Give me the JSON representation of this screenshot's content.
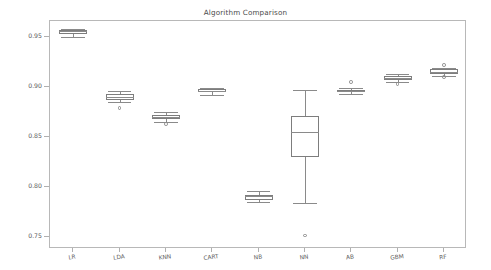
{
  "figure": {
    "width": 491,
    "height": 270,
    "background": "#ffffff",
    "frame_color": "#b8b8b8",
    "line_color": "#8a8a8a"
  },
  "chart_data": {
    "type": "box",
    "title": "Algorithm Comparison",
    "xlabel": "",
    "ylabel": "Error",
    "ylim": [
      0.7375,
      0.9665
    ],
    "yticks": [
      0.95,
      0.9,
      0.85,
      0.8,
      0.75
    ],
    "ytick_labels": [
      "0.95",
      "0.90",
      "0.85",
      "0.80",
      "0.75"
    ],
    "grid": false,
    "legend": "none",
    "categories": [
      "LR",
      "LDA",
      "KNN",
      "CART",
      "NB",
      "NN",
      "AB",
      "GBM",
      "RF"
    ],
    "boxes": [
      {
        "name": "LR",
        "whisker_low": 0.9505,
        "q1": 0.9535,
        "median": 0.9565,
        "q3": 0.9575,
        "whisker_high": 0.958,
        "fliers": []
      },
      {
        "name": "LDA",
        "whisker_low": 0.8855,
        "q1": 0.8875,
        "median": 0.8905,
        "q3": 0.893,
        "whisker_high": 0.896,
        "fliers": [
          0.879
        ]
      },
      {
        "name": "KNN",
        "whisker_low": 0.865,
        "q1": 0.868,
        "median": 0.87,
        "q3": 0.8725,
        "whisker_high": 0.8755,
        "fliers": [
          0.863
        ]
      },
      {
        "name": "CART",
        "whisker_low": 0.8925,
        "q1": 0.895,
        "median": 0.8965,
        "q3": 0.898,
        "whisker_high": 0.899,
        "fliers": []
      },
      {
        "name": "NB",
        "whisker_low": 0.785,
        "q1": 0.787,
        "median": 0.7905,
        "q3": 0.792,
        "whisker_high": 0.7955,
        "fliers": []
      },
      {
        "name": "NN",
        "whisker_low": 0.7835,
        "q1": 0.8295,
        "median": 0.8555,
        "q3": 0.8715,
        "whisker_high": 0.897,
        "fliers": [
          0.751
        ]
      },
      {
        "name": "AB",
        "whisker_low": 0.8935,
        "q1": 0.895,
        "median": 0.8965,
        "q3": 0.8975,
        "whisker_high": 0.899,
        "fliers": [
          0.905
        ]
      },
      {
        "name": "GBM",
        "whisker_low": 0.9055,
        "q1": 0.9075,
        "median": 0.909,
        "q3": 0.911,
        "whisker_high": 0.9135,
        "fliers": [
          0.903
        ]
      },
      {
        "name": "RF",
        "whisker_low": 0.911,
        "q1": 0.913,
        "median": 0.9155,
        "q3": 0.918,
        "whisker_high": 0.9195,
        "fliers": [
          0.9225,
          0.91
        ]
      }
    ]
  }
}
